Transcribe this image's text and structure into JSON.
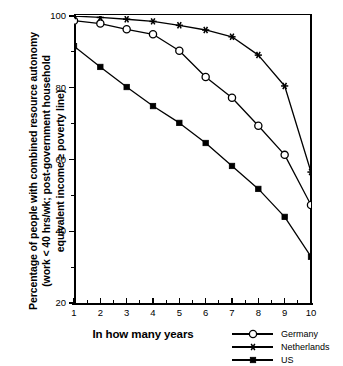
{
  "chart_data": {
    "type": "line",
    "title": "",
    "xlabel": "In how many years",
    "ylabel": "Percentage of people with combined resource autonomy (work < 40 hrs/wk; post-government household equivalent income ≥ poverty line)",
    "ylabel_lines": [
      "Percentage of people with combined resource autonomy",
      "(work < 40 hrs/wk; post-government household",
      "equivalent income ≥ poverty line)"
    ],
    "x": [
      1,
      2,
      3,
      4,
      5,
      6,
      7,
      8,
      9,
      10
    ],
    "categories": [
      "1",
      "2",
      "3",
      "4",
      "5",
      "6",
      "7",
      "8",
      "9",
      "10"
    ],
    "xlim": [
      1,
      10
    ],
    "ylim": [
      20,
      100
    ],
    "ytick_labels": [
      "100",
      "80",
      "60",
      "40",
      "20"
    ],
    "yticks": [
      100,
      80,
      60,
      40,
      20
    ],
    "yticks_minor": [
      90,
      70,
      50,
      30
    ],
    "grid": false,
    "legend_position": "bottom-right",
    "series": [
      {
        "name": "Germany",
        "marker": "open-circle",
        "values": [
          98.7,
          97.9,
          96.3,
          94.9,
          90.3,
          83.0,
          77.2,
          69.4,
          61.3,
          47.3
        ]
      },
      {
        "name": "Netherlands",
        "marker": "star",
        "values": [
          100.0,
          99.6,
          99.1,
          98.5,
          97.4,
          96.1,
          94.2,
          89.1,
          80.5,
          56.5
        ]
      },
      {
        "name": "US",
        "marker": "filled-square",
        "values": [
          91.6,
          85.8,
          80.2,
          74.9,
          70.2,
          64.6,
          58.2,
          51.8,
          44.0,
          32.9
        ]
      }
    ]
  },
  "legend": {
    "entries": [
      {
        "label": "Germany",
        "marker": "open-circle"
      },
      {
        "label": "Netherlands",
        "marker": "star"
      },
      {
        "label": "US",
        "marker": "filled-square"
      }
    ]
  },
  "colors": {
    "ink": "#000000",
    "background": "#ffffff"
  }
}
